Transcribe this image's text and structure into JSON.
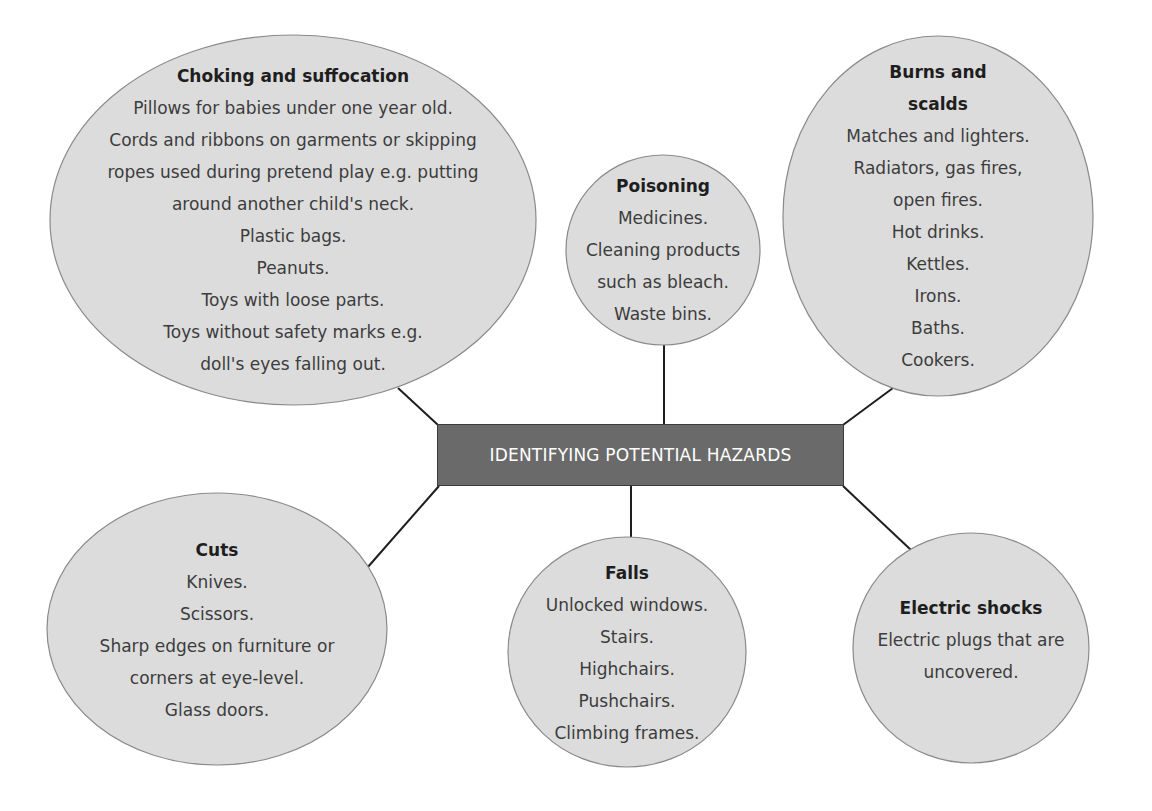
{
  "colors": {
    "bubble_fill": "#dcdcdc",
    "bubble_stroke": "#8a8a8a",
    "center_fill": "#6a6a6a",
    "center_text": "#ffffff",
    "connector": "#1e1e1e"
  },
  "center": {
    "label": "IDENTIFYING POTENTIAL HAZARDS"
  },
  "nodes": {
    "choking": {
      "title": "Choking and suffocation",
      "lines": [
        "Pillows for babies under one year old.",
        "Cords and ribbons on garments or skipping",
        "ropes used during pretend play e.g. putting",
        "around another child's neck.",
        "Plastic bags.",
        "Peanuts.",
        "Toys with loose parts.",
        "Toys without safety marks e.g.",
        "doll's eyes falling out."
      ]
    },
    "poisoning": {
      "title": "Poisoning",
      "lines": [
        "Medicines.",
        "Cleaning products",
        "such as bleach.",
        "Waste bins."
      ]
    },
    "burns": {
      "title_lines": [
        "Burns and",
        "scalds"
      ],
      "lines": [
        "Matches and lighters.",
        "Radiators, gas fires,",
        "open fires.",
        "Hot drinks.",
        "Kettles.",
        "Irons.",
        "Baths.",
        "Cookers."
      ]
    },
    "cuts": {
      "title": "Cuts",
      "lines": [
        "Knives.",
        "Scissors.",
        "Sharp edges on furniture or",
        "corners at eye-level.",
        "Glass doors."
      ]
    },
    "falls": {
      "title": "Falls",
      "lines": [
        "Unlocked windows.",
        "Stairs.",
        "Highchairs.",
        "Pushchairs.",
        "Climbing frames."
      ]
    },
    "electric": {
      "title": "Electric shocks",
      "lines": [
        "Electric plugs that are",
        "uncovered."
      ]
    }
  }
}
